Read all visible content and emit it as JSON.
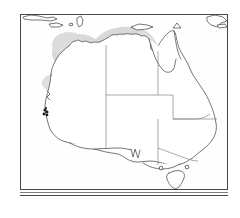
{
  "figure": {
    "frame": {
      "x": 20,
      "y": 14,
      "width": 208,
      "height": 176,
      "border_color": "#4a4a4a"
    },
    "baseline_strip": {
      "x": 20,
      "y": 192,
      "width": 208,
      "height": 4
    },
    "background_color": "#ffffff",
    "land_fill": "#ffffff",
    "coast_stroke": "#3c3c3c",
    "state_border_stroke": "#6e6e6e",
    "range_fill": "#d8d8d8",
    "range_fill_light": "#e3e3e3",
    "locality_dot_color": "#1a1a1a"
  },
  "map": {
    "region_name": "Australia",
    "projection_note": "",
    "landmasses": [
      {
        "name": "australia-mainland",
        "label": "Mainland Australia"
      },
      {
        "name": "tasmania",
        "label": "Tasmania"
      },
      {
        "name": "northern-islands",
        "label": "Indonesian and New Guinea islands"
      }
    ],
    "states": [
      {
        "name": "western-australia",
        "code": "WA"
      },
      {
        "name": "northern-territory",
        "code": "NT"
      },
      {
        "name": "queensland",
        "code": "QLD"
      },
      {
        "name": "south-australia",
        "code": "SA"
      },
      {
        "name": "new-south-wales",
        "code": "NSW"
      },
      {
        "name": "victoria",
        "code": "VIC"
      },
      {
        "name": "tasmania-state",
        "code": "TAS"
      }
    ]
  },
  "distribution": {
    "legend_note": "",
    "shaded_regions": [
      {
        "name": "kimberley-range",
        "label": "Kimberley",
        "fill": "#d8d8d8"
      },
      {
        "name": "pilbara-range",
        "label": "Pilbara",
        "fill": "#dcdcdc"
      },
      {
        "name": "inland-wa-range",
        "label": "Inland Western Australia",
        "fill": "#e0e0e0"
      },
      {
        "name": "top-end-range",
        "label": "Top End",
        "fill": "#d8d8d8"
      },
      {
        "name": "gulf-range",
        "label": "Gulf of Carpentaria",
        "fill": "#dedede"
      },
      {
        "name": "east-coast-range",
        "label": "Queensland east coast",
        "fill": "#d6d6d6"
      }
    ],
    "locality_points": [
      {
        "name": "southwest-locality",
        "label": "Southwest Western Australia"
      }
    ]
  }
}
